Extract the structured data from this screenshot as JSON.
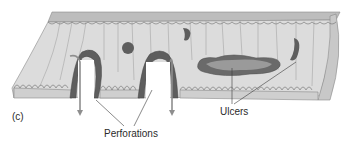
{
  "figure": {
    "panel_label": "(c)",
    "labels": {
      "perforations": "Perforations",
      "ulcers": "Ulcers"
    },
    "colors": {
      "tissue_fill": "#d9d9d9",
      "tissue_top": "#bdbdbd",
      "tissue_edge": "#8a8a8a",
      "lesion_dark": "#5a5a5a",
      "lesion_mid": "#7d7d7d",
      "ulcer_inner": "#9a9a9a",
      "arrow": "#9e9e9e",
      "leader_line": "#3a3a3a"
    }
  }
}
